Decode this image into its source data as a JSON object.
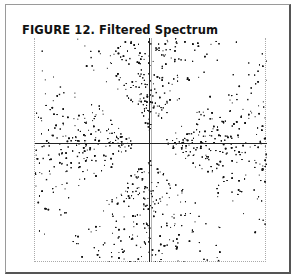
{
  "figure": {
    "title": "FIGURE 12. Filtered Spectrum"
  },
  "chart_data": {
    "type": "scatter",
    "title": "FIGURE 12. Filtered Spectrum",
    "xlabel": "",
    "ylabel": "",
    "lobes": [
      "top",
      "bottom",
      "left",
      "right"
    ],
    "filtered_bands": [
      "diagonal 45°",
      "diagonal 135°"
    ],
    "grid": false,
    "legend": null
  },
  "colors": {
    "ink": "#111111",
    "frame": "#555555",
    "background": "#ffffff"
  }
}
